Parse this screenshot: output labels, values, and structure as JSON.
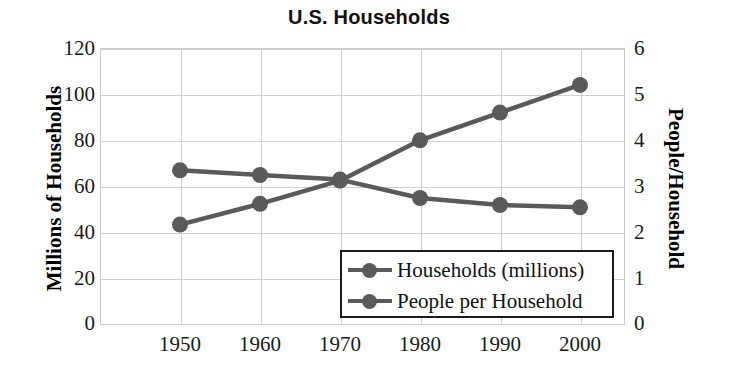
{
  "chart_data": {
    "type": "line",
    "title": "U.S. Households",
    "xlabel": "",
    "categories": [
      "1950",
      "1960",
      "1970",
      "1980",
      "1990",
      "2000"
    ],
    "x": [
      1950,
      1960,
      1970,
      1980,
      1990,
      2000
    ],
    "grid": true,
    "legend_position": "inside-bottom-center",
    "series": [
      {
        "name": "Households (millions)",
        "axis": "left",
        "color": "#5a5a5a",
        "marker": "circle",
        "values": [
          43.5,
          52.5,
          62.5,
          80,
          92,
          104
        ]
      },
      {
        "name": "People per Household",
        "axis": "right",
        "color": "#5a5a5a",
        "marker": "circle",
        "values": [
          3.35,
          3.25,
          3.15,
          2.75,
          2.6,
          2.55
        ]
      }
    ],
    "axes": {
      "left": {
        "label": "Millions of Households",
        "ticks": [
          "0",
          "20",
          "40",
          "60",
          "80",
          "100",
          "120"
        ],
        "tick_values": [
          0,
          20,
          40,
          60,
          80,
          100,
          120
        ],
        "range": [
          0,
          120
        ]
      },
      "right": {
        "label": "People/Household",
        "ticks": [
          "0",
          "1",
          "2",
          "3",
          "4",
          "5",
          "6"
        ],
        "tick_values": [
          0,
          1,
          2,
          3,
          4,
          5,
          6
        ],
        "range": [
          0,
          6
        ]
      },
      "bottom": {
        "label": "",
        "ticks": [
          "1950",
          "1960",
          "1970",
          "1980",
          "1990",
          "2000"
        ]
      }
    },
    "colors": {
      "series": "#5a5a5a",
      "grid": "#cfcfcf",
      "plot_border": "#c9c9c9",
      "legend_border": "#1a1a1a",
      "text": "#111111",
      "background": "#ffffff"
    }
  },
  "legend": {
    "entries": [
      {
        "label": "Households (millions)"
      },
      {
        "label": "People per Household"
      }
    ]
  }
}
